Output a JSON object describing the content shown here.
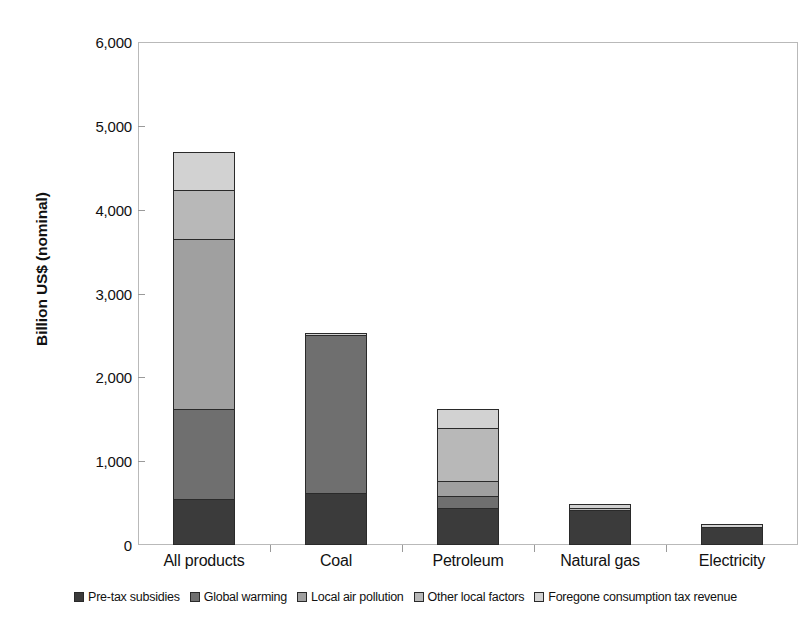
{
  "chart_data": {
    "type": "bar",
    "subtype": "stacked-column",
    "title": "",
    "xlabel": "",
    "ylabel": "Billion US$ (nominal)",
    "ylim": [
      0,
      6000
    ],
    "ytick_values": [
      0,
      1000,
      2000,
      3000,
      4000,
      5000,
      6000
    ],
    "ytick_labels": [
      "0",
      "1,000",
      "2,000",
      "3,000",
      "4,000",
      "5,000",
      "6,000"
    ],
    "grid": false,
    "legend_position": "bottom",
    "categories": [
      "All products",
      "Coal",
      "Petroleum",
      "Natural gas",
      "Electricity"
    ],
    "series": [
      {
        "name": "Pre-tax subsidies",
        "color": "#3b3b3b",
        "values": [
          550,
          620,
          440,
          420,
          215
        ]
      },
      {
        "name": "Global warming",
        "color": "#6f6f6f",
        "values": [
          1070,
          1880,
          140,
          0,
          0
        ]
      },
      {
        "name": "Local air pollution",
        "color": "#a0a0a0",
        "values": [
          2030,
          0,
          180,
          0,
          0
        ]
      },
      {
        "name": "Other local factors",
        "color": "#b8b8b8",
        "values": [
          590,
          0,
          640,
          20,
          0
        ]
      },
      {
        "name": "Foregone consumption tax revenue",
        "color": "#d2d2d2",
        "values": [
          450,
          30,
          220,
          50,
          40
        ]
      }
    ],
    "totals": [
      4690,
      2530,
      1620,
      490,
      255
    ]
  },
  "legend": {
    "items": [
      {
        "label": "Pre-tax subsidies",
        "swatch": "#3b3b3b"
      },
      {
        "label": "Global warming",
        "swatch": "#6f6f6f"
      },
      {
        "label": "Local air pollution",
        "swatch": "#a0a0a0"
      },
      {
        "label": "Other local factors",
        "swatch": "#b8b8b8"
      },
      {
        "label": "Foregone consumption tax revenue",
        "swatch": "#d2d2d2"
      }
    ]
  }
}
